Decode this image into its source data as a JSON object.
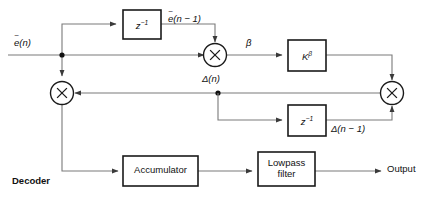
{
  "figure": {
    "caption": "Decoder",
    "type": "block-diagram"
  },
  "signals": {
    "input": "ẽ(n)",
    "input_base": "e",
    "input_arg": "(n)",
    "delayed_input": "ẽ(n − 1)",
    "delayed_input_arg": "(n − 1)",
    "beta": "β",
    "delta": "Δ(n)",
    "delta_delayed": "Δ(n − 1)",
    "output": "Output"
  },
  "blocks": {
    "delay_top": {
      "label": "z",
      "exponent": "−1"
    },
    "delay_bottom": {
      "label": "z",
      "exponent": "−1"
    },
    "gain": {
      "label": "K",
      "exponent": "β"
    },
    "accumulator": {
      "label": "Accumulator"
    },
    "lowpass": {
      "line1": "Lowpass",
      "line2": "filter"
    }
  },
  "operators": {
    "mult_left": "×",
    "mult_beta": "×",
    "mult_right": "×"
  },
  "colors": {
    "wire": "#7a7a7a",
    "stroke": "#1a1a1a",
    "text": "#111111",
    "background": "#ffffff"
  }
}
